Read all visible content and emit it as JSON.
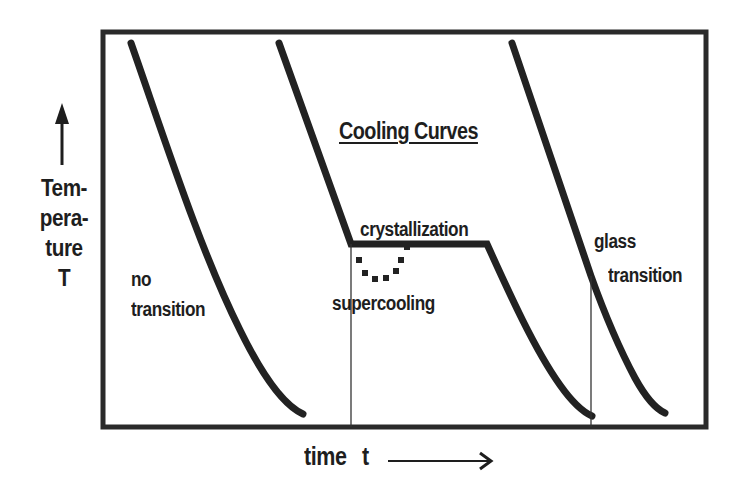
{
  "diagram": {
    "title": "Cooling Curves",
    "y_axis": {
      "arrow_icon": "up-arrow",
      "label_lines": [
        "Tem-",
        "pera-",
        "ture",
        "T"
      ]
    },
    "x_axis": {
      "label_word": "time",
      "label_symbol": "t",
      "arrow_icon": "right-arrow"
    },
    "curves": [
      {
        "name": "no transition",
        "label_lines": [
          "no",
          "transition"
        ]
      },
      {
        "name": "crystallization",
        "plateau_label": "crystallization",
        "supercooling_label": "supercooling"
      },
      {
        "name": "glass transition",
        "label_lines": [
          "glass",
          "transition"
        ]
      }
    ],
    "colors": {
      "ink": "#1e1e1e",
      "background": "#ffffff"
    }
  }
}
